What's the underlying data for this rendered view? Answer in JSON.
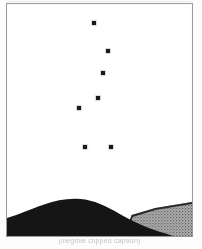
{
  "figure": {
    "caption": "(illegible clipped caption)",
    "frame_color": "#9a9a9a",
    "background_color": "#ffffff"
  },
  "chart_data": {
    "type": "scatter",
    "title": "",
    "subtitle": "",
    "xlabel": "",
    "ylabel": "",
    "xlim": [
      0,
      187
    ],
    "ylim": [
      0,
      234
    ],
    "grid": false,
    "legend": null,
    "marker": {
      "shape": "square",
      "size_px": 4,
      "color": "#1a1a1a"
    },
    "note": "Seven dark square markers plotted against a blank white sky field above a horizon silhouette.",
    "series": [
      {
        "name": "markers",
        "points": [
          {
            "id": 1,
            "x": 85,
            "y": 17
          },
          {
            "id": 2,
            "x": 99,
            "y": 45
          },
          {
            "id": 3,
            "x": 94,
            "y": 67
          },
          {
            "id": 4,
            "x": 89,
            "y": 92
          },
          {
            "id": 5,
            "x": 70,
            "y": 102
          },
          {
            "id": 6,
            "x": 76,
            "y": 141
          },
          {
            "id": 7,
            "x": 102,
            "y": 141
          }
        ]
      }
    ],
    "annotations": [
      {
        "name": "dark-hill",
        "type": "silhouette",
        "fill": "#151515",
        "description": "large black foreground hill occupying the left and centre of the horizon"
      },
      {
        "name": "stippled-hill",
        "type": "silhouette",
        "fill": "#9c9c9c",
        "description": "lighter stippled ridge rising behind on the right side"
      }
    ]
  },
  "terrain": {
    "dark_hill_color": "#151515",
    "stippled_hill_color": "#9c9c9c",
    "stipple_dot_color": "#4a4a4a"
  }
}
